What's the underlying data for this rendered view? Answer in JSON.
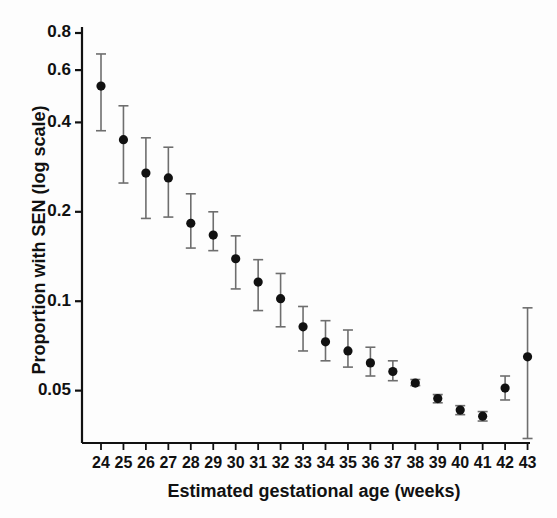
{
  "chart_data": {
    "type": "scatter",
    "title": "",
    "xlabel": "Estimated gestational age (weeks)",
    "ylabel": "Proportion with SEN (log scale)",
    "yscale": "log",
    "grid": false,
    "legend": "none",
    "marker": "filled-circle",
    "marker_color": "#111111",
    "errorbar_color": "#6e6e6e",
    "errorbar_style": "vertical-capped",
    "xlim": [
      23.3,
      43.7
    ],
    "ylim": [
      0.031,
      0.88
    ],
    "ytick_labels": [
      "0.8",
      "0.6",
      "0.4",
      "0.2",
      "0.1",
      "0.05"
    ],
    "yticks": [
      0.8,
      0.6,
      0.4,
      0.2,
      0.1,
      0.05
    ],
    "xtick_labels": [
      "24",
      "25",
      "26",
      "27",
      "28",
      "29",
      "30",
      "31",
      "32",
      "33",
      "34",
      "35",
      "36",
      "37",
      "38",
      "39",
      "40",
      "41",
      "42",
      "43"
    ],
    "x": [
      24,
      25,
      26,
      27,
      28,
      29,
      30,
      31,
      32,
      33,
      34,
      35,
      36,
      37,
      38,
      39,
      40,
      41,
      42,
      43
    ],
    "categories": [
      "24",
      "25",
      "26",
      "27",
      "28",
      "29",
      "30",
      "31",
      "32",
      "33",
      "34",
      "35",
      "36",
      "37",
      "38",
      "39",
      "40",
      "41",
      "42",
      "43"
    ],
    "values": [
      0.53,
      0.35,
      0.27,
      0.26,
      0.183,
      0.167,
      0.139,
      0.116,
      0.102,
      0.082,
      0.073,
      0.068,
      0.062,
      0.058,
      0.053,
      0.047,
      0.043,
      0.041,
      0.051,
      0.065
    ],
    "ci_low": [
      0.375,
      0.25,
      0.19,
      0.192,
      0.151,
      0.148,
      0.11,
      0.093,
      0.082,
      0.068,
      0.063,
      0.06,
      0.056,
      0.054,
      0.052,
      0.0455,
      0.0415,
      0.0395,
      0.0465,
      0.0345
    ],
    "ci_high": [
      0.68,
      0.455,
      0.355,
      0.33,
      0.23,
      0.2,
      0.166,
      0.138,
      0.124,
      0.096,
      0.086,
      0.08,
      0.07,
      0.063,
      0.0545,
      0.0485,
      0.0445,
      0.0425,
      0.056,
      0.095
    ],
    "series": [
      {
        "name": "Proportion with SEN",
        "values": [
          0.53,
          0.35,
          0.27,
          0.26,
          0.183,
          0.167,
          0.139,
          0.116,
          0.102,
          0.082,
          0.073,
          0.068,
          0.062,
          0.058,
          0.053,
          0.047,
          0.043,
          0.041,
          0.051,
          0.065
        ]
      }
    ],
    "points": [
      {
        "week": "24",
        "value": 0.53,
        "low": 0.375,
        "high": 0.68
      },
      {
        "week": "25",
        "value": 0.35,
        "low": 0.25,
        "high": 0.455
      },
      {
        "week": "26",
        "value": 0.27,
        "low": 0.19,
        "high": 0.355
      },
      {
        "week": "27",
        "value": 0.26,
        "low": 0.192,
        "high": 0.33
      },
      {
        "week": "28",
        "value": 0.183,
        "low": 0.151,
        "high": 0.23
      },
      {
        "week": "29",
        "value": 0.167,
        "low": 0.148,
        "high": 0.2
      },
      {
        "week": "30",
        "value": 0.139,
        "low": 0.11,
        "high": 0.166
      },
      {
        "week": "31",
        "value": 0.116,
        "low": 0.093,
        "high": 0.138
      },
      {
        "week": "32",
        "value": 0.102,
        "low": 0.082,
        "high": 0.124
      },
      {
        "week": "33",
        "value": 0.082,
        "low": 0.068,
        "high": 0.096
      },
      {
        "week": "34",
        "value": 0.073,
        "low": 0.063,
        "high": 0.086
      },
      {
        "week": "35",
        "value": 0.068,
        "low": 0.06,
        "high": 0.08
      },
      {
        "week": "36",
        "value": 0.062,
        "low": 0.056,
        "high": 0.07
      },
      {
        "week": "37",
        "value": 0.058,
        "low": 0.054,
        "high": 0.063
      },
      {
        "week": "38",
        "value": 0.053,
        "low": 0.052,
        "high": 0.0545
      },
      {
        "week": "39",
        "value": 0.047,
        "low": 0.0455,
        "high": 0.0485
      },
      {
        "week": "40",
        "value": 0.043,
        "low": 0.0415,
        "high": 0.0445
      },
      {
        "week": "41",
        "value": 0.041,
        "low": 0.0395,
        "high": 0.0425
      },
      {
        "week": "42",
        "value": 0.051,
        "low": 0.0465,
        "high": 0.056
      },
      {
        "week": "43",
        "value": 0.065,
        "low": 0.0345,
        "high": 0.095
      }
    ]
  }
}
